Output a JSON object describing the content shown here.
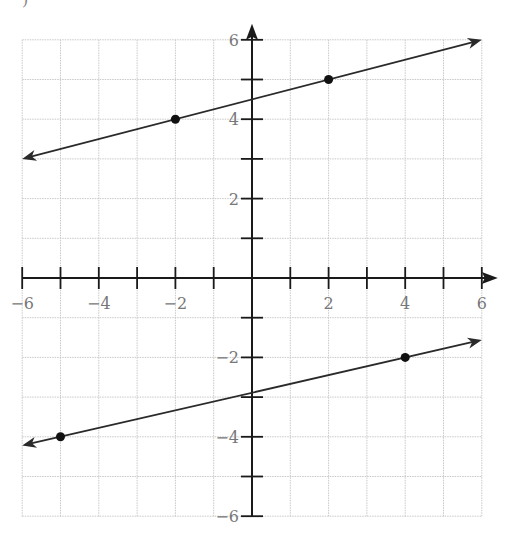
{
  "caption": ")",
  "chart_data": {
    "type": "line",
    "title": "",
    "xlabel": "",
    "ylabel": "",
    "xlim": [
      -6,
      6
    ],
    "ylim": [
      -6,
      6
    ],
    "grid": true,
    "x_tick_labels": [
      "-6",
      "-4",
      "-2",
      "2",
      "4",
      "6"
    ],
    "y_tick_labels": [
      "6",
      "4",
      "2",
      "-2",
      "-4",
      "-6"
    ],
    "series": [
      {
        "name": "upper line",
        "points": [
          [
            -2,
            4
          ],
          [
            2,
            5
          ]
        ],
        "slope": 0.25,
        "intercept": 4.5,
        "endpoints": [
          [
            -6,
            3
          ],
          [
            6,
            6
          ]
        ]
      },
      {
        "name": "lower line",
        "points": [
          [
            -5,
            -4
          ],
          [
            4,
            -2
          ]
        ],
        "slope": 0.2222,
        "intercept": -2.889,
        "endpoints": [
          [
            -6,
            -4.22
          ],
          [
            6,
            -1.56
          ]
        ]
      }
    ]
  },
  "colors": {
    "grid": "#c8c8c8",
    "axis": "#1a1a1a",
    "line": "#2a2a2a",
    "label": "#777777"
  }
}
